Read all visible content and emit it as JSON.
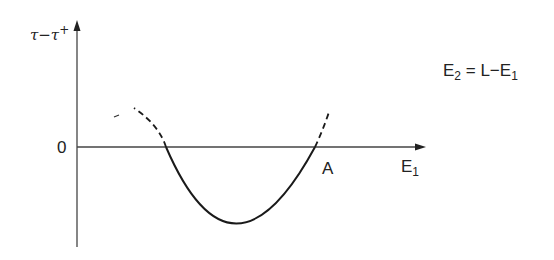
{
  "diagram": {
    "y_axis_label": {
      "base": "τ−τ",
      "sup": "+"
    },
    "origin_label": "0",
    "x_axis_label": {
      "base": "E",
      "sub": "1"
    },
    "point_label": "A",
    "equation": {
      "lhs": "E",
      "lhs_sub": "2",
      "rhs": "= L−E",
      "rhs_sub": "1"
    },
    "curve": {
      "shape": "parabola",
      "solid_between_roots": true,
      "dashed_above_axis": true
    },
    "colors": {
      "line": "#1a1a1a",
      "axis": "#444444"
    }
  }
}
